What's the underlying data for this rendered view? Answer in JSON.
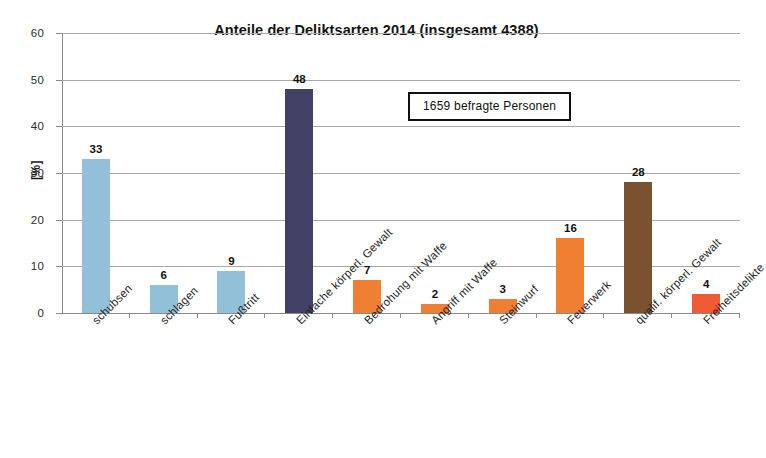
{
  "chart_data": {
    "type": "bar",
    "title": "Anteile der Deliktsarten 2014 (insgesamt 4388)",
    "xlabel": "",
    "ylabel": "[%]",
    "ylim": [
      0,
      60
    ],
    "ytick_step": 10,
    "yticks": [
      "60",
      "50",
      "40",
      "30",
      "20",
      "10",
      "0"
    ],
    "grid": true,
    "legend": "none",
    "categories": [
      "schubsen",
      "schlagen",
      "Fußtritt",
      "Einfache körperl. Gewalt",
      "Bedrohung mit Waffe",
      "Angriff mit Waffe",
      "Steinwurf",
      "Feuerwerk",
      "qualif. körperl. Gewalt",
      "Freiheitsdelikte"
    ],
    "values": [
      33,
      6,
      9,
      48,
      7,
      2,
      3,
      16,
      28,
      4
    ],
    "value_labels": [
      "33",
      "6",
      "9",
      "48",
      "7",
      "2",
      "3",
      "16",
      "28",
      "4"
    ],
    "bar_colors": [
      "#92c0d8",
      "#92c0d8",
      "#92c0d8",
      "#434066",
      "#ef8033",
      "#ef8033",
      "#ef8033",
      "#ef8033",
      "#7a5230",
      "#f05a34"
    ],
    "annotations": [
      {
        "text": "1659 befragte Personen",
        "style": "boxed"
      }
    ]
  },
  "colors": {
    "light_blue": "#92c0d8",
    "dark_navy": "#434066",
    "orange": "#ef8033",
    "brown": "#7a5230",
    "red": "#f05a34",
    "gridline": "#a8a8a8",
    "axis": "#8a8a8a",
    "background": "#ffffff"
  }
}
